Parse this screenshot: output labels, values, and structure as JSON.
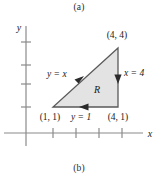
{
  "figure": {
    "panel_top_label": "(a)",
    "panel_bottom_label": "(b)",
    "axes": {
      "x_axis_label": "x",
      "y_axis_label": "y",
      "x_tick_count": 4,
      "y_tick_count": 4,
      "grid": false
    },
    "region": {
      "name": "R",
      "fill_color": "#e3e3e3",
      "stroke_color": "#5a5a5a",
      "vertices": [
        {
          "label": "(1, 1)",
          "x": 1,
          "y": 1
        },
        {
          "label": "(4, 1)",
          "x": 4,
          "y": 1
        },
        {
          "label": "(4, 4)",
          "x": 4,
          "y": 4
        }
      ]
    },
    "edge_labels": {
      "hypotenuse": "y = x",
      "right_edge": "x = 4",
      "bottom_edge": "y = 1"
    },
    "vertex_labels": {
      "bottom_left": "(1, 1)",
      "bottom_right": "(4, 1)",
      "top_right": "(4, 4)"
    },
    "orientation": {
      "bottom_edge_arrow": "left",
      "right_edge_arrow": "down",
      "hypotenuse_arrow": "up-right"
    },
    "colors": {
      "axis": "#8a8a8a",
      "text": "#1a1a1a",
      "boundary": "#5a5a5a",
      "fill": "#e3e3e3"
    }
  }
}
